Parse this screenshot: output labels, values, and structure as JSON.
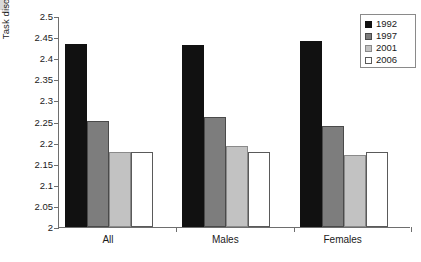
{
  "chart_data": {
    "type": "bar",
    "title": "",
    "xlabel": "",
    "ylabel": "Task discretion index",
    "categories": [
      "All",
      "Males",
      "Females"
    ],
    "series": [
      {
        "name": "1992",
        "color": "#111111",
        "values": [
          2.434,
          2.431,
          2.441
        ]
      },
      {
        "name": "1997",
        "color": "#7d7d7d",
        "values": [
          2.251,
          2.261,
          2.239
        ]
      },
      {
        "name": "2001",
        "color": "#c2c2c2",
        "values": [
          2.178,
          2.191,
          2.171
        ]
      },
      {
        "name": "2006",
        "color": "#ffffff",
        "values": [
          2.178,
          2.178,
          2.178
        ]
      }
    ],
    "ylim": [
      2,
      2.5
    ],
    "y_ticks": [
      "2.5",
      "2.45",
      "2.4",
      "2.35",
      "2.3",
      "2.25",
      "2.2",
      "2.15",
      "2.1",
      "2.05",
      "2"
    ],
    "y_tick_values": [
      2.5,
      2.45,
      2.4,
      2.35,
      2.3,
      2.25,
      2.2,
      2.15,
      2.1,
      2.05,
      2
    ],
    "grid": false,
    "legend_position": "top-right",
    "legend_entries": [
      "1992",
      "1997",
      "2001",
      "2006"
    ]
  }
}
